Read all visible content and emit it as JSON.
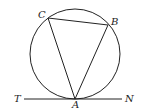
{
  "diagram": {
    "type": "geometry",
    "circle": {
      "cx": 75,
      "cy": 54,
      "r": 45
    },
    "points": {
      "A": {
        "label": "A",
        "x": 75,
        "y": 99
      },
      "B": {
        "label": "B",
        "x": 108,
        "y": 25
      },
      "C": {
        "label": "C",
        "x": 48,
        "y": 18
      }
    },
    "tangent": {
      "left_label": "T",
      "right_label": "N",
      "x1": 24,
      "x2": 122,
      "y": 99
    },
    "stroke_color": "#222222"
  }
}
